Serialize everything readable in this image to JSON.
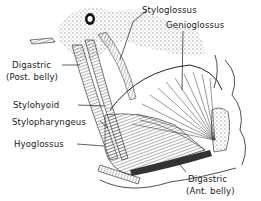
{
  "figure": {
    "labels": {
      "styloglossus": "Styloglossus",
      "genioglossus": "Genioglossus",
      "digastric_post_line1": "Digastric",
      "digastric_post_line2": "(Post. belly)",
      "stylohyoid": "Stylohyoid",
      "stylopharyngeus": "Stylopharyngeus",
      "hyoglossus": "Hyoglossus",
      "digastric_ant_line1": "Digastric",
      "digastric_ant_line2": "(Ant. belly)"
    },
    "colors": {
      "ink": "#1a1a1a",
      "paper": "#ffffff"
    }
  }
}
